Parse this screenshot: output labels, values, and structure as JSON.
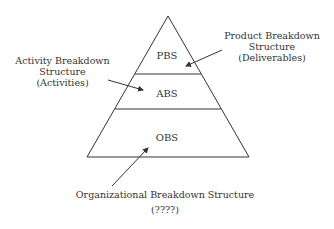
{
  "diagram": {
    "type": "pyramid",
    "layers": [
      {
        "label": "PBS"
      },
      {
        "label": "ABS"
      },
      {
        "label": "OBS"
      }
    ],
    "annotations": {
      "product": {
        "line1": "Product Breakdown",
        "line2": "Structure",
        "line3": "(Deliverables)"
      },
      "activity": {
        "line1": "Activity Breakdown",
        "line2": "Structure",
        "line3": "(Activities)"
      },
      "organizational": {
        "line1": "Organizational Breakdown Structure",
        "line2": "(????)"
      }
    },
    "colors": {
      "stroke": "#333333",
      "text": "#333333",
      "background": "#ffffff"
    }
  }
}
